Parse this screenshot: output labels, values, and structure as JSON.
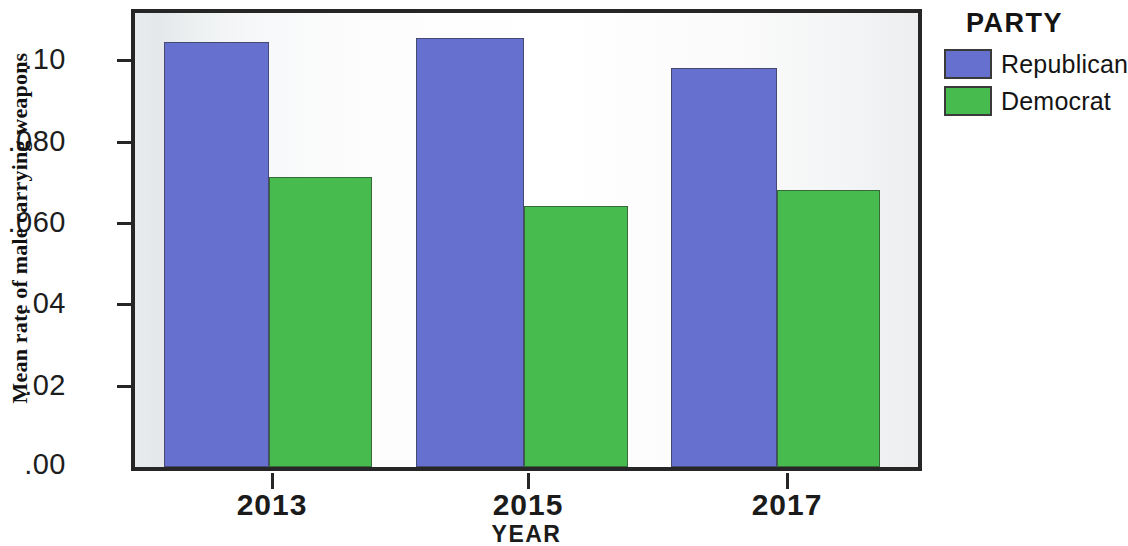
{
  "chart_data": {
    "type": "bar",
    "title": "",
    "xlabel": "YEAR",
    "ylabel": "Mean rate of male carrying weapons",
    "categories": [
      "2013",
      "2015",
      "2017"
    ],
    "series": [
      {
        "name": "Republican",
        "color": "#6670cf",
        "values": [
          0.101,
          0.102,
          0.095
        ]
      },
      {
        "name": "Democrat",
        "color": "#48bb4e",
        "values": [
          0.069,
          0.062,
          0.066
        ]
      }
    ],
    "ylim": [
      0.0,
      0.108
    ],
    "ytick_values": [
      0.0,
      0.02,
      0.04,
      0.06,
      0.08,
      0.1
    ],
    "ytick_labels": [
      ".00",
      ".02",
      ".04",
      ".060",
      ".080",
      ".10"
    ],
    "grid": false,
    "legend_position": "right",
    "legend_title": "PARTY"
  },
  "legend": {
    "title": "PARTY",
    "entries": [
      {
        "label": "Republican",
        "color": "#6670cf"
      },
      {
        "label": "Democrat",
        "color": "#48bb4e"
      }
    ]
  },
  "axes": {
    "y_title": "Mean rate of male carrying weapons",
    "x_title": "YEAR",
    "y_ticks": [
      {
        "label": ".10",
        "value": 0.1
      },
      {
        "label": ".080",
        "value": 0.08
      },
      {
        "label": ".060",
        "value": 0.06
      },
      {
        "label": ".04",
        "value": 0.04
      },
      {
        "label": ".02",
        "value": 0.02
      },
      {
        "label": ".00",
        "value": 0.0
      }
    ],
    "x_ticks": [
      {
        "label": "2013"
      },
      {
        "label": "2015"
      },
      {
        "label": "2017"
      }
    ]
  }
}
